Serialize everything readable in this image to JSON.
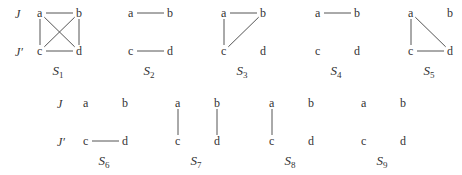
{
  "row_labels": {
    "top": [
      "J",
      "J′"
    ],
    "bottom": [
      "J",
      "J′"
    ]
  },
  "graphs": [
    {
      "name": "S",
      "sub": "1",
      "nodes": [
        "a",
        "b",
        "c",
        "d"
      ],
      "edges": [
        [
          "a",
          "b"
        ],
        [
          "c",
          "d"
        ],
        [
          "a",
          "c"
        ],
        [
          "b",
          "d"
        ],
        [
          "a",
          "d"
        ],
        [
          "b",
          "c"
        ]
      ]
    },
    {
      "name": "S",
      "sub": "2",
      "nodes": [
        "a",
        "b",
        "c",
        "d"
      ],
      "edges": [
        [
          "a",
          "b"
        ],
        [
          "c",
          "d"
        ]
      ]
    },
    {
      "name": "S",
      "sub": "3",
      "nodes": [
        "a",
        "b",
        "c",
        "d"
      ],
      "edges": [
        [
          "a",
          "b"
        ],
        [
          "a",
          "c"
        ],
        [
          "b",
          "c"
        ]
      ]
    },
    {
      "name": "S",
      "sub": "4",
      "nodes": [
        "a",
        "b",
        "c",
        "d"
      ],
      "edges": [
        [
          "a",
          "b"
        ]
      ]
    },
    {
      "name": "S",
      "sub": "5",
      "nodes": [
        "a",
        "b",
        "c",
        "d"
      ],
      "edges": [
        [
          "a",
          "c"
        ],
        [
          "a",
          "d"
        ],
        [
          "c",
          "d"
        ]
      ]
    },
    {
      "name": "S",
      "sub": "6",
      "nodes": [
        "a",
        "b",
        "c",
        "d"
      ],
      "edges": [
        [
          "c",
          "d"
        ]
      ]
    },
    {
      "name": "S",
      "sub": "7",
      "nodes": [
        "a",
        "b",
        "c",
        "d"
      ],
      "edges": [
        [
          "a",
          "c"
        ],
        [
          "b",
          "d"
        ]
      ]
    },
    {
      "name": "S",
      "sub": "8",
      "nodes": [
        "a",
        "b",
        "c",
        "d"
      ],
      "edges": [
        [
          "a",
          "c"
        ]
      ]
    },
    {
      "name": "S",
      "sub": "9",
      "nodes": [
        "a",
        "b",
        "c",
        "d"
      ],
      "edges": []
    }
  ]
}
